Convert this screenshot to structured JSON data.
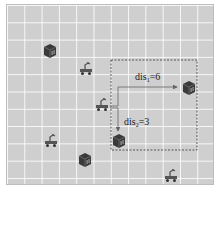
{
  "diagram": {
    "title": "",
    "colors": {
      "grid_bg": "#cfcfcf",
      "grid_line": "#ffffff",
      "shelf": "#3a3a3a",
      "robot": "#555555",
      "dashed_region": "#555555",
      "arrow": "#666666"
    },
    "shelves": [
      {
        "id": "shelf-1",
        "x": 42,
        "y": 43
      },
      {
        "id": "shelf-2",
        "x": 181,
        "y": 80
      },
      {
        "id": "shelf-3",
        "x": 111,
        "y": 133
      },
      {
        "id": "shelf-4",
        "x": 77,
        "y": 152
      }
    ],
    "robots": [
      {
        "id": "robot-1",
        "x": 78,
        "y": 60
      },
      {
        "id": "robot-center",
        "x": 94,
        "y": 96
      },
      {
        "id": "robot-3",
        "x": 43,
        "y": 132
      },
      {
        "id": "robot-4",
        "x": 163,
        "y": 167
      }
    ],
    "region": {
      "x": 111,
      "y": 60,
      "w": 86,
      "h": 90
    },
    "distances": [
      {
        "base": "dis",
        "sub": "1",
        "value": "=6",
        "label_x": 135,
        "label_y": 72
      },
      {
        "base": "dis",
        "sub": "2",
        "value": "=3",
        "label_x": 124,
        "label_y": 117
      }
    ]
  }
}
